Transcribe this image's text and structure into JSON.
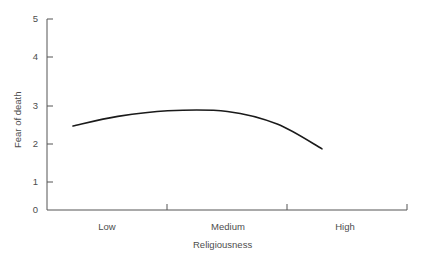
{
  "chart_data": {
    "type": "line",
    "title": "",
    "subtitle": "",
    "xlabel": "Religiousness",
    "ylabel": "Fear of death",
    "categories": [
      "Low",
      "Medium",
      "High"
    ],
    "x_tick_labels": [
      "Low",
      "Medium",
      "High"
    ],
    "y_tick_labels": [
      "0",
      "1",
      "2",
      "3",
      "4",
      "5"
    ],
    "y_ticks": [
      0,
      1,
      2,
      3,
      4,
      5
    ],
    "ylim": [
      0,
      5
    ],
    "grid": false,
    "legend": false,
    "legend_position": "none",
    "line_color": "#1a1a1a",
    "series": [
      {
        "name": "Fear of death",
        "x": [
          "Low",
          "Medium",
          "High"
        ],
        "values": [
          2.3,
          2.6,
          1.8
        ],
        "points": [
          {
            "x_frac": 0.0,
            "value": 2.2
          },
          {
            "x_frac": 0.18,
            "value": 2.45
          },
          {
            "x_frac": 0.38,
            "value": 2.6
          },
          {
            "x_frac": 0.62,
            "value": 2.58
          },
          {
            "x_frac": 0.82,
            "value": 2.25
          },
          {
            "x_frac": 1.0,
            "value": 1.6
          }
        ]
      }
    ]
  },
  "axes": {
    "y_axis_label": "Fear of death",
    "x_axis_label": "Religiousness",
    "y_tick_0": "0",
    "y_tick_1": "1",
    "y_tick_2": "2",
    "y_tick_3": "3",
    "y_tick_4": "4",
    "y_tick_5": "5",
    "x_tick_low": "Low",
    "x_tick_medium": "Medium",
    "x_tick_high": "High"
  }
}
